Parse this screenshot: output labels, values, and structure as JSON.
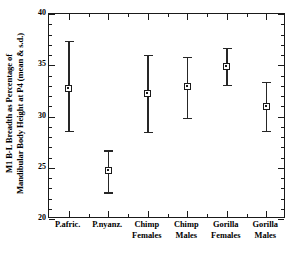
{
  "chart_data": {
    "type": "scatter",
    "title": "",
    "subtitle": "",
    "xlabel": "",
    "ylabel": "M1 B-L Breadth as Percentage of Mandibular Body Height at P4 (mean & s.d.)",
    "ylabel_lines": [
      "M1 B-L Breadth as Percentage of",
      "Mandibular Body Height at P4 (mean & s.d.)"
    ],
    "ylim": [
      20,
      40
    ],
    "yticks": [
      20,
      25,
      30,
      35,
      40
    ],
    "ytick_labels": [
      "20",
      "25",
      "30",
      "35",
      "40"
    ],
    "y_minor_tick_step": 1,
    "grid": false,
    "legend": null,
    "error_type": "s.d.",
    "categories": [
      "P.afric.",
      "P.nyanz.",
      "Chimp Females",
      "Chimp Males",
      "Gorilla Females",
      "Gorilla Males"
    ],
    "category_label_lines": [
      [
        "P.afric.",
        ""
      ],
      [
        "P.nyanz.",
        ""
      ],
      [
        "Chimp",
        "Females"
      ],
      [
        "Chimp",
        "Males"
      ],
      [
        "Gorilla",
        "Females"
      ],
      [
        "Gorilla",
        "Males"
      ]
    ],
    "values": [
      32.7,
      24.7,
      32.2,
      32.9,
      34.9,
      31.0
    ],
    "errors_upper": [
      37.4,
      26.7,
      36.0,
      35.8,
      36.7,
      33.4
    ],
    "errors_lower": [
      28.6,
      22.6,
      28.5,
      29.9,
      33.1,
      28.6
    ],
    "series": [
      {
        "name": "M1 B-L breadth as % of mandibular body height at P4",
        "points": [
          {
            "category": "P.afric.",
            "mean": 32.7,
            "sd_upper": 37.4,
            "sd_lower": 28.6
          },
          {
            "category": "P.nyanz.",
            "mean": 24.7,
            "sd_upper": 26.7,
            "sd_lower": 22.6
          },
          {
            "category": "Chimp Females",
            "mean": 32.2,
            "sd_upper": 36.0,
            "sd_lower": 28.5
          },
          {
            "category": "Chimp Males",
            "mean": 32.9,
            "sd_upper": 35.8,
            "sd_lower": 29.9
          },
          {
            "category": "Gorilla Females",
            "mean": 34.9,
            "sd_upper": 36.7,
            "sd_lower": 33.1
          },
          {
            "category": "Gorilla Males",
            "mean": 31.0,
            "sd_upper": 33.4,
            "sd_lower": 28.6
          }
        ]
      }
    ],
    "marker_style": "open-square-with-dot",
    "colors": {
      "axis": "#1a1a1a",
      "marker": "#1a1a1a",
      "errorbar": "#262626",
      "background": "#ffffff"
    }
  }
}
